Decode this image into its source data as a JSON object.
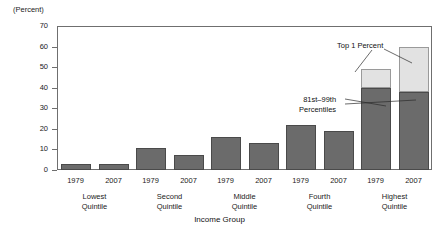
{
  "axis": {
    "unit_label": "(Percent)",
    "x_title": "Income Group",
    "y_ticks": [
      "0",
      "10",
      "20",
      "30",
      "40",
      "50",
      "60",
      "70"
    ]
  },
  "annotations": {
    "top1": "Top 1 Percent",
    "p81_99_line1": "81st–99th",
    "p81_99_line2": "Percentiles"
  },
  "groups": [
    {
      "name": "Lowest Quintile",
      "line1": "Lowest",
      "line2": "Quintile",
      "years": [
        {
          "year": "1979"
        },
        {
          "year": "2007"
        }
      ]
    },
    {
      "name": "Second Quintile",
      "line1": "Second",
      "line2": "Quintile",
      "years": [
        {
          "year": "1979"
        },
        {
          "year": "2007"
        }
      ]
    },
    {
      "name": "Middle Quintile",
      "line1": "Middle",
      "line2": "Quintile",
      "years": [
        {
          "year": "1979"
        },
        {
          "year": "2007"
        }
      ]
    },
    {
      "name": "Fourth Quintile",
      "line1": "Fourth",
      "line2": "Quintile",
      "years": [
        {
          "year": "1979"
        },
        {
          "year": "2007"
        }
      ]
    },
    {
      "name": "Highest Quintile",
      "line1": "Highest",
      "line2": "Quintile",
      "years": [
        {
          "year": "1979"
        },
        {
          "year": "2007"
        }
      ]
    }
  ],
  "colors": {
    "dark_gray": "#6b6b6b",
    "light_gray": "#e2e2e2",
    "axis": "#6f6f6f",
    "text": "#222222"
  },
  "chart_data": {
    "type": "bar",
    "title": "",
    "subtitle": "",
    "xlabel": "Income Group",
    "ylabel": "(Percent)",
    "ylim": [
      0,
      70
    ],
    "yticks": [
      0,
      10,
      20,
      30,
      40,
      50,
      60,
      70
    ],
    "grid": false,
    "legend_position": "annotations",
    "stacked": true,
    "categories": [
      "Lowest Quintile 1979",
      "Lowest Quintile 2007",
      "Second Quintile 1979",
      "Second Quintile 2007",
      "Middle Quintile 1979",
      "Middle Quintile 2007",
      "Fourth Quintile 1979",
      "Fourth Quintile 2007",
      "Highest Quintile 1979",
      "Highest Quintile 2007"
    ],
    "series": [
      {
        "name": "81st–99th Percentiles",
        "color": "#6b6b6b",
        "values": [
          3,
          3,
          10.5,
          7.5,
          16,
          13,
          22,
          19,
          40,
          38
        ]
      },
      {
        "name": "Top 1 Percent",
        "color": "#e2e2e2",
        "values": [
          0,
          0,
          0,
          0,
          0,
          0,
          0,
          0,
          9,
          22
        ]
      }
    ],
    "totals": [
      3,
      3,
      10.5,
      7.5,
      16,
      13,
      22,
      19,
      49,
      60
    ],
    "annotations": [
      {
        "text": "Top 1 Percent",
        "points_to": [
          "Highest Quintile 1979 top segment",
          "Highest Quintile 2007 top segment"
        ]
      },
      {
        "text": "81st–99th Percentiles",
        "points_to": [
          "Highest Quintile 1979 bottom segment",
          "Highest Quintile 2007 bottom segment"
        ]
      }
    ]
  }
}
